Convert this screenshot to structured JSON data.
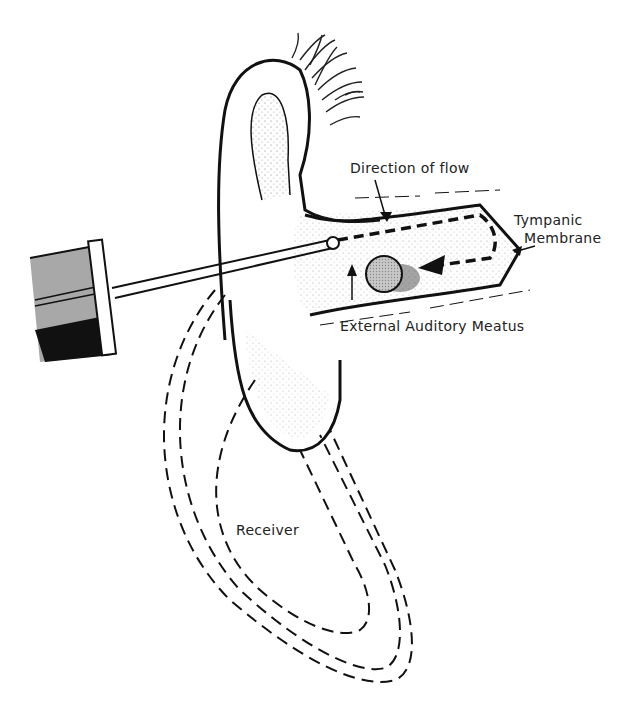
{
  "figure": {
    "labels": {
      "direction_of_flow": "Direction of flow",
      "tympanic": "Tympanic",
      "membrane": "Membrane",
      "external_auditory_meatus": "External Auditory Meatus",
      "receiver": "Receiver"
    },
    "colors": {
      "ink": "#111111",
      "stipple": "#9a9a9a",
      "object_fill": "#bdbdbd",
      "syringe_gray": "#a8a8a8",
      "background": "#ffffff"
    }
  }
}
